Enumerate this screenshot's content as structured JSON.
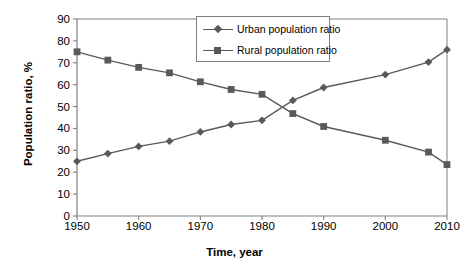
{
  "chart_data": {
    "type": "line",
    "title": "",
    "xlabel": "Time, year",
    "ylabel": "Population ratio, %",
    "xlim": [
      1950,
      2010
    ],
    "ylim": [
      0,
      90
    ],
    "xticks": [
      1950,
      1960,
      1970,
      1980,
      1990,
      2000,
      2010
    ],
    "yticks": [
      0,
      10,
      20,
      30,
      40,
      50,
      60,
      70,
      80,
      90
    ],
    "grid": false,
    "legend_position": "top-center",
    "x": [
      1950,
      1955,
      1960,
      1965,
      1970,
      1975,
      1980,
      1985,
      1990,
      2000,
      2007,
      2010
    ],
    "series": [
      {
        "name": "Urban population ratio",
        "marker": "diamond",
        "color": "#595959",
        "values": [
          25.0,
          28.5,
          31.8,
          34.2,
          38.4,
          41.8,
          43.7,
          52.8,
          58.7,
          64.6,
          70.3,
          76.0
        ]
      },
      {
        "name": "Rural population ratio",
        "marker": "square",
        "color": "#595959",
        "values": [
          75.0,
          71.2,
          67.9,
          65.4,
          61.3,
          57.8,
          55.6,
          46.8,
          40.9,
          34.6,
          29.2,
          23.5
        ]
      }
    ]
  },
  "axis": {
    "ylabel": "Population ratio, %",
    "xlabel": "Time, year",
    "yticks": [
      "90",
      "80",
      "70",
      "60",
      "50",
      "40",
      "30",
      "20",
      "10",
      "0"
    ],
    "xticks": [
      "1950",
      "1960",
      "1970",
      "1980",
      "1990",
      "2000",
      "2010"
    ]
  },
  "legend": {
    "items": [
      {
        "label": "Urban population ratio"
      },
      {
        "label": "Rural population ratio"
      }
    ]
  },
  "colors": {
    "series": "#595959",
    "axis": "#808080",
    "text": "#000000"
  }
}
